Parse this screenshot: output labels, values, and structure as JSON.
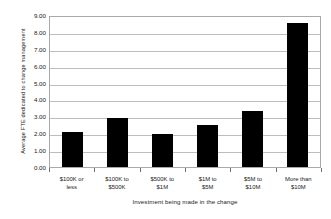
{
  "chart_data": {
    "type": "bar",
    "title": "",
    "subtitle": "",
    "xlabel": "Investment being made in the change",
    "ylabel": "Average FTE dedicated to change management",
    "categories": [
      "$100K or less",
      "$100K to $500K",
      "$500K to $1M",
      "$1M to $5M",
      "$5M to $10M",
      "More than $10M"
    ],
    "category_lines": [
      [
        "$100K or",
        "less"
      ],
      [
        "$100K to",
        "$500K"
      ],
      [
        "$500K to",
        "$1M"
      ],
      [
        "$1M to",
        "$5M"
      ],
      [
        "$5M to",
        "$10M"
      ],
      [
        "More than",
        "$10M"
      ]
    ],
    "values": [
      2.1,
      2.9,
      1.93,
      2.5,
      3.3,
      8.55
    ],
    "ylim": [
      0,
      9
    ],
    "ytick_values": [
      0,
      1,
      2,
      3,
      4,
      5,
      6,
      7,
      8,
      9
    ],
    "ytick_labels": [
      "0.00",
      "1.00",
      "2.00",
      "3.00",
      "4.00",
      "5.00",
      "6.00",
      "7.00",
      "8.00",
      "9.00"
    ],
    "grid": true,
    "grid_axis": "y",
    "legend": false,
    "legend_position": "none",
    "bar_color": "#000000",
    "grid_color": "#bdbdbd",
    "axis_color": "#a9a9a9",
    "background_color": "#ffffff"
  }
}
